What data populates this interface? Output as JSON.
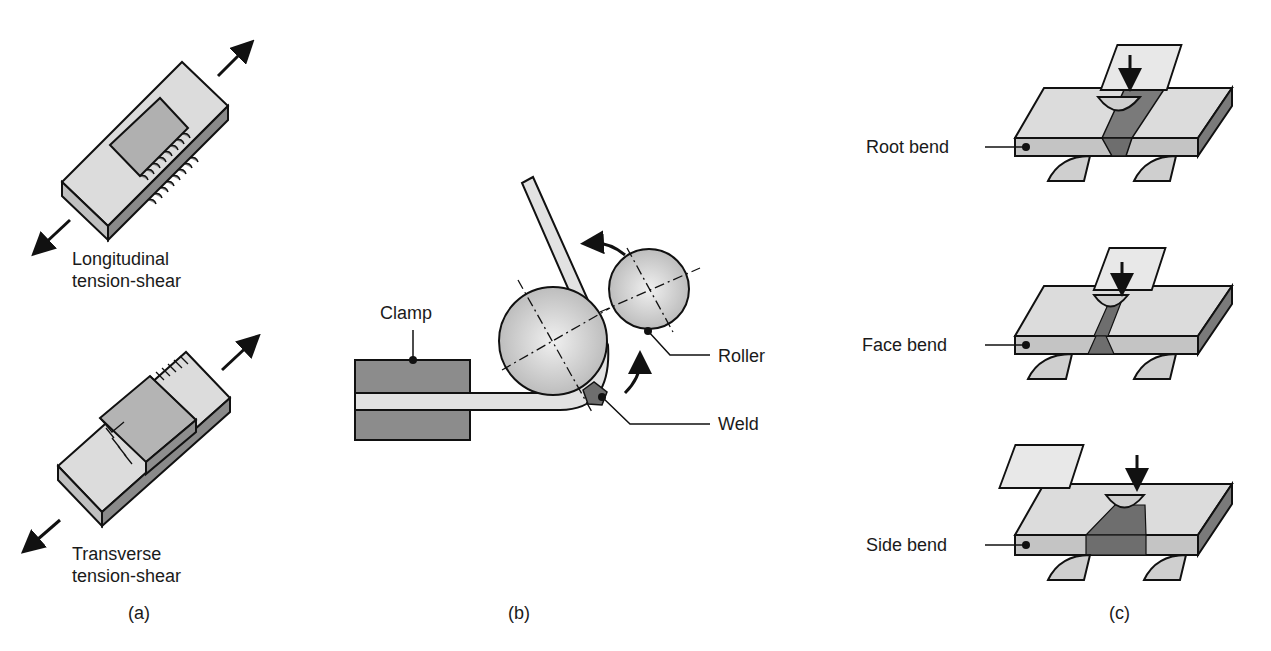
{
  "figure": {
    "panels": [
      {
        "id": "a",
        "caption": "(a)",
        "specimens": [
          {
            "label_line1": "Longitudinal",
            "label_line2": "tension-shear"
          },
          {
            "label_line1": "Transverse",
            "label_line2": "tension-shear"
          }
        ]
      },
      {
        "id": "b",
        "caption": "(b)",
        "labels": {
          "clamp": "Clamp",
          "roller": "Roller",
          "weld": "Weld"
        }
      },
      {
        "id": "c",
        "caption": "(c)",
        "tests": [
          {
            "label": "Root bend"
          },
          {
            "label": "Face bend"
          },
          {
            "label": "Side bend"
          }
        ]
      }
    ],
    "colors": {
      "light_gray": "#dcdcdc",
      "mid_gray": "#a8a8a8",
      "dark_gray": "#7a7a7a",
      "weld_gray": "#6e6e6e",
      "outline": "#111111"
    }
  }
}
